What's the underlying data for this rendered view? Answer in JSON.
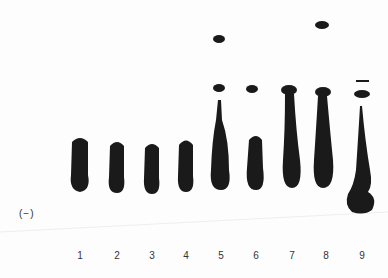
{
  "figure": {
    "polarity_label": "(−)",
    "lanes": [
      {
        "label": "1",
        "x": 80
      },
      {
        "label": "2",
        "x": 117
      },
      {
        "label": "3",
        "x": 152
      },
      {
        "label": "4",
        "x": 186
      },
      {
        "label": "5",
        "x": 221
      },
      {
        "label": "6",
        "x": 256
      },
      {
        "label": "7",
        "x": 292
      },
      {
        "label": "8",
        "x": 325
      },
      {
        "label": "9",
        "x": 363
      }
    ],
    "ink_color": "#1a1a1a"
  }
}
